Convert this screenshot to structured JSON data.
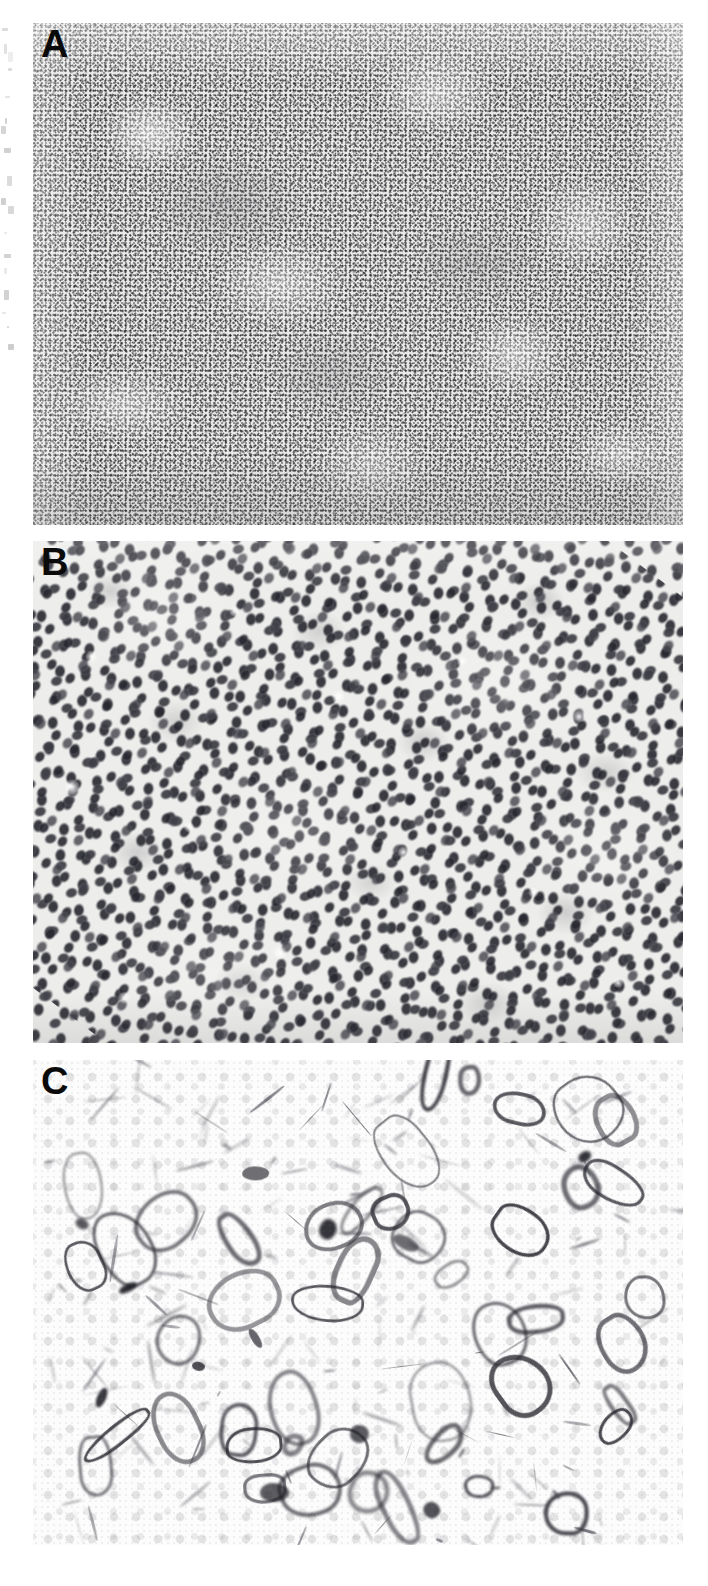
{
  "figure": {
    "name": "histopathology-figure",
    "background_color": "#ffffff",
    "width": 708,
    "height": 1586
  },
  "panels": [
    {
      "id": "a",
      "label": "A",
      "name": "panel-a",
      "description": "Low-magnification photomicrograph showing diffuse sheets of densely packed small dark nuclei with scattered paler nodular areas",
      "magnification": "low",
      "stain_appearance": "hematoxylin-eosin",
      "tone": "medium-gray stippled",
      "x": 33,
      "y": 23,
      "width": 650,
      "height": 502
    },
    {
      "id": "b",
      "label": "B",
      "name": "panel-b",
      "description": "High-magnification photomicrograph showing dense population of cells with dark ovoid nuclei, pale cytoplasm and scattered clear vacuoles",
      "magnification": "high",
      "stain_appearance": "hematoxylin-eosin",
      "tone": "light-gray with dark nuclei",
      "x": 33,
      "y": 541,
      "width": 650,
      "height": 502
    },
    {
      "id": "c",
      "label": "C",
      "name": "panel-c",
      "description": "Immunohistochemical stain showing sparse dark membranous and dendritic ring-like positive structures on a pale unstained background of faint ghost nuclei",
      "magnification": "high",
      "stain_appearance": "immunohistochemistry",
      "tone": "pale background with dark focal positivity",
      "x": 33,
      "y": 1060,
      "width": 650,
      "height": 485
    }
  ],
  "margin_artifacts": {
    "name": "scan-margin-artifacts",
    "description": "Faint fragments of adjacent page text captured along the left edge of the scan",
    "visible": true
  },
  "colors": {
    "page_background": "#ffffff",
    "panel_a_base": "#e8e8e6",
    "panel_b_base": "#ededeb",
    "panel_c_base": "#fcfcfc",
    "label_color": "#0a0a0a",
    "nuclei_dark": "#30303a",
    "stain_dark": "#232a2a"
  },
  "label_style": {
    "font_weight": "bold",
    "font_size_px": 38
  }
}
